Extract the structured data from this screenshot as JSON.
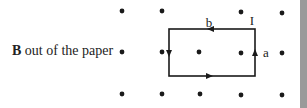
{
  "diagram": {
    "field_label": {
      "symbol": "B",
      "text": " out of the paper"
    },
    "loop_labels": {
      "top": "b",
      "right": "a",
      "current": "I"
    },
    "colors": {
      "line": "#1a1a1a",
      "dot": "#1a1a1a",
      "text": "#222222",
      "edge_bar": "#9a9a9a"
    },
    "dots": [
      [
        122,
        11
      ],
      [
        162,
        11
      ],
      [
        241,
        12
      ],
      [
        282,
        13
      ],
      [
        122,
        52
      ],
      [
        162,
        52
      ],
      [
        199,
        52
      ],
      [
        241,
        53
      ],
      [
        282,
        53
      ],
      [
        122,
        94
      ],
      [
        162,
        94
      ],
      [
        200,
        94
      ],
      [
        241,
        95
      ],
      [
        282,
        95
      ]
    ],
    "loop": {
      "x1": 169,
      "y1": 29,
      "x2": 255,
      "y2": 76
    }
  }
}
